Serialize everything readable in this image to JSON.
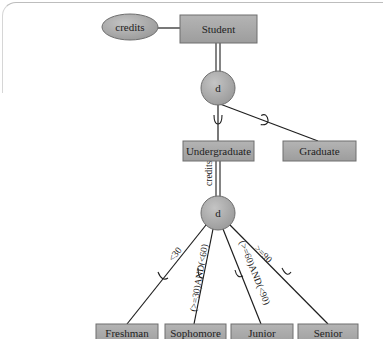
{
  "diagram": {
    "type": "EER specialization hierarchy",
    "colors": {
      "entity_fill": "#a9a9a9",
      "entity_stroke": "#6e6e6e",
      "circle_fill": "#b0b0b0",
      "line": "#1f1f1f",
      "text": "#222222"
    },
    "attribute": {
      "label": "credits"
    },
    "superclass": {
      "label": "Student"
    },
    "top_specialization": {
      "symbol": "d",
      "subclasses": [
        {
          "label": "Undergraduate"
        },
        {
          "label": "Graduate"
        }
      ]
    },
    "bottom_specialization": {
      "symbol": "d",
      "defining_attribute": "credits",
      "subclasses": [
        {
          "label": "Freshman",
          "predicate": "<30"
        },
        {
          "label": "Sophomore",
          "predicate": "(>=30)AND(<60)"
        },
        {
          "label": "Junior",
          "predicate": "(>=60)AND(<90)"
        },
        {
          "label": "Senior",
          "predicate": ">=90"
        }
      ]
    }
  }
}
